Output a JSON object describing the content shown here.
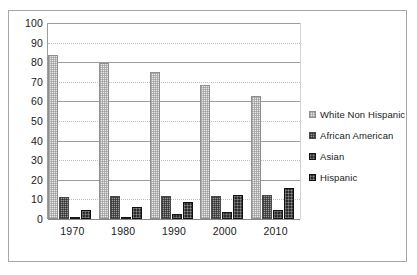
{
  "chart_data": {
    "type": "bar",
    "title": "",
    "subtitle": "",
    "xlabel": "",
    "ylabel": "",
    "ylim": [
      0,
      100
    ],
    "ytick_step": 10,
    "yticks": [
      100,
      90,
      80,
      70,
      60,
      50,
      40,
      30,
      20,
      10,
      0
    ],
    "categories": [
      "1970",
      "1980",
      "1990",
      "2000",
      "2010"
    ],
    "grid": true,
    "grid_axis": "y",
    "legend_position": "right",
    "series": [
      {
        "name": "White Non Hispanic",
        "swatch_style": "light-checkered",
        "color": "#e9e9e9",
        "values": [
          83.5,
          79.5,
          75.0,
          68.5,
          63.0
        ]
      },
      {
        "name": "African American",
        "swatch_style": "medium-checkered",
        "color": "#9a9a9a",
        "values": [
          11.0,
          11.5,
          11.7,
          11.7,
          12.2
        ]
      },
      {
        "name": "Asian",
        "swatch_style": "dark-solid",
        "color": "#2f2f2f",
        "values": [
          0.7,
          1.2,
          2.6,
          3.4,
          4.7
        ]
      },
      {
        "name": "Hispanic",
        "swatch_style": "dark-solid",
        "color": "#2a2a2a",
        "values": [
          4.5,
          6.2,
          8.7,
          12.0,
          15.7
        ]
      }
    ]
  },
  "legend": {
    "items": [
      {
        "label": "White Non Hispanic"
      },
      {
        "label": "African American"
      },
      {
        "label": "Asian"
      },
      {
        "label": "Hispanic"
      }
    ]
  }
}
